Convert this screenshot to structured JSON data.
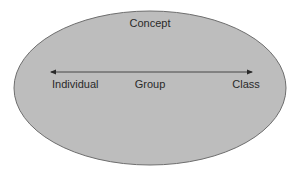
{
  "diagram": {
    "title": "Concept",
    "container_shape": "ellipse",
    "colors": {
      "ellipse_fill": "#bdbdbd",
      "ellipse_stroke": "#6e6e6e",
      "arrow": "#2a2a2a",
      "text": "#2a2a2a",
      "background": "#ffffff"
    },
    "axis": {
      "type": "double-headed-arrow",
      "labels": [
        {
          "text": "Individual",
          "position": "left"
        },
        {
          "text": "Group",
          "position": "center"
        },
        {
          "text": "Class",
          "position": "right"
        }
      ]
    }
  }
}
